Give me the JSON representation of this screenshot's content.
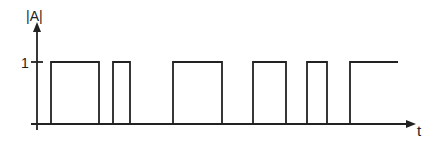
{
  "chart_data": {
    "type": "line",
    "subtype": "step",
    "title": "",
    "xlabel": "t",
    "ylabel": "|A|",
    "y_ticks": [
      {
        "value": 1,
        "label": "1"
      }
    ],
    "ylim": [
      0,
      1
    ],
    "grid": false,
    "legend": null,
    "series": [
      {
        "name": "|A|(t)",
        "description": "Rectangular pulse train switching between 0 and 1",
        "pulses": [
          {
            "start": 51,
            "end": 99
          },
          {
            "start": 113,
            "end": 130
          },
          {
            "start": 173,
            "end": 222
          },
          {
            "start": 253,
            "end": 286
          },
          {
            "start": 307,
            "end": 327
          },
          {
            "start": 350,
            "end": 398,
            "open_ended": true
          }
        ],
        "levels": {
          "low": 0,
          "high": 1
        }
      }
    ]
  },
  "axes": {
    "y_label": "|A|",
    "x_label": "t",
    "tick_one_label": "1"
  },
  "colors": {
    "line": "#222222",
    "background": "#ffffff"
  }
}
